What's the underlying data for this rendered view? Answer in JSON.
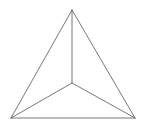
{
  "figure": {
    "type": "triangular-pyramid-top-view",
    "width": 143,
    "height": 126,
    "background": "#ffffff",
    "stroke_color": "#555555",
    "stroke_width": 0.8,
    "vertices": {
      "apex": [
        72,
        10
      ],
      "center": [
        72,
        83
      ],
      "bottom_left": [
        11,
        118
      ],
      "bottom_right": [
        135,
        118
      ]
    },
    "edges": [
      [
        "apex",
        "bottom_left"
      ],
      [
        "apex",
        "bottom_right"
      ],
      [
        "bottom_left",
        "bottom_right"
      ],
      [
        "apex",
        "center"
      ],
      [
        "center",
        "bottom_left"
      ],
      [
        "center",
        "bottom_right"
      ]
    ]
  }
}
